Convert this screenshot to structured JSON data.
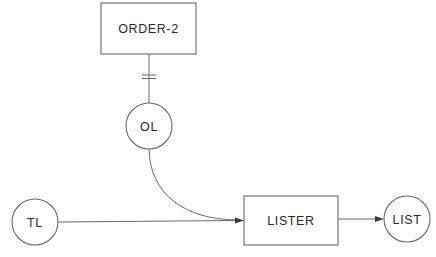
{
  "diagram": {
    "type": "data-flow",
    "nodes": {
      "order2": {
        "label": "ORDER-2",
        "shape": "rectangle"
      },
      "ol": {
        "label": "OL",
        "shape": "circle"
      },
      "tl": {
        "label": "TL",
        "shape": "circle"
      },
      "lister": {
        "label": "LISTER",
        "shape": "rectangle"
      },
      "list": {
        "label": "LIST",
        "shape": "circle"
      }
    },
    "edges": [
      {
        "from": "ORDER-2",
        "to": "OL",
        "style": "line-with-double-bar"
      },
      {
        "from": "OL",
        "to": "LISTER",
        "style": "curved-arrow"
      },
      {
        "from": "TL",
        "to": "LISTER",
        "style": "arrow"
      },
      {
        "from": "LISTER",
        "to": "LIST",
        "style": "arrow"
      }
    ],
    "colors": {
      "stroke": "#6a6a6a",
      "text": "#2a2a2a",
      "background": "#ffffff"
    }
  }
}
